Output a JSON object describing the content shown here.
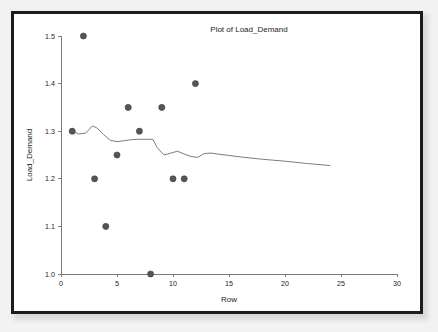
{
  "chart_data": {
    "type": "scatter",
    "title": "Plot of Load_Demand",
    "xlabel": "Row",
    "ylabel": "Load_Demand",
    "xlim": [
      0,
      30
    ],
    "ylim": [
      1.0,
      1.5
    ],
    "xticks": [
      0,
      5,
      10,
      15,
      20,
      25,
      30
    ],
    "xtick_labels": [
      "0",
      "5",
      "10",
      "15",
      "20",
      "25",
      "30"
    ],
    "yticks": [
      1.0,
      1.1,
      1.2,
      1.3,
      1.4,
      1.5
    ],
    "ytick_labels": [
      "1.0",
      "1.1",
      "1.2",
      "1.3",
      "1.4",
      "1.5"
    ],
    "grid": false,
    "legend": null,
    "series": [
      {
        "name": "Load_Demand",
        "kind": "scatter",
        "marker": "filled-circle",
        "color": "#555555",
        "x": [
          1,
          2,
          3,
          4,
          5,
          6,
          7,
          8,
          9,
          10,
          11,
          12
        ],
        "y": [
          1.3,
          1.5,
          1.2,
          1.1,
          1.25,
          1.35,
          1.3,
          1.0,
          1.35,
          1.2,
          1.2,
          1.4
        ]
      },
      {
        "name": "Trend",
        "kind": "line",
        "color": "#6e6e6e",
        "x": [
          1,
          1.6,
          2.2,
          2.8,
          3.2,
          3.8,
          4.4,
          5.0,
          5.6,
          6.2,
          6.8,
          7.4,
          7.8,
          8.2,
          8.6,
          9.2,
          9.8,
          10.4,
          11.0,
          11.6,
          12.2,
          12.8,
          13.4,
          14.0,
          16.0,
          18.0,
          20.0,
          22.0,
          24.0
        ],
        "y": [
          1.3,
          1.294,
          1.296,
          1.311,
          1.307,
          1.293,
          1.281,
          1.278,
          1.28,
          1.282,
          1.283,
          1.283,
          1.283,
          1.283,
          1.265,
          1.25,
          1.254,
          1.258,
          1.252,
          1.247,
          1.245,
          1.253,
          1.254,
          1.252,
          1.246,
          1.241,
          1.237,
          1.232,
          1.228
        ]
      }
    ]
  },
  "frame": {
    "border_color": "#1c1c1c",
    "page_background": "#f2f2f2",
    "plot_background": "#ffffff"
  }
}
